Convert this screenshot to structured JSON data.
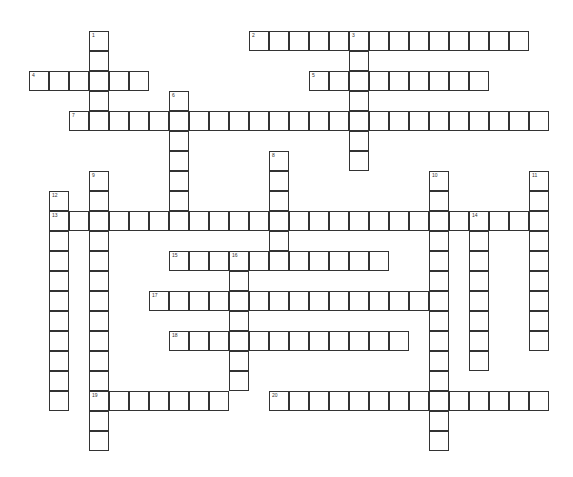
{
  "puzzle": {
    "type": "crossword",
    "cell_size": 20,
    "origin_x": 29,
    "origin_y": 31,
    "colors": {
      "border": "#333333",
      "cell_fill": "#ffffff",
      "background": "#ffffff"
    },
    "entries": [
      {
        "number": "1",
        "direction": "down",
        "col": 3,
        "row": 0,
        "length": 5
      },
      {
        "number": "2",
        "direction": "across",
        "col": 11,
        "row": 0,
        "length": 14
      },
      {
        "number": "3",
        "direction": "down",
        "col": 16,
        "row": 0,
        "length": 7
      },
      {
        "number": "4",
        "direction": "across",
        "col": 0,
        "row": 2,
        "length": 6
      },
      {
        "number": "5",
        "direction": "across",
        "col": 14,
        "row": 2,
        "length": 9
      },
      {
        "number": "6",
        "direction": "down",
        "col": 7,
        "row": 3,
        "length": 7
      },
      {
        "number": "7",
        "direction": "across",
        "col": 2,
        "row": 4,
        "length": 24
      },
      {
        "number": "8",
        "direction": "down",
        "col": 12,
        "row": 6,
        "length": 6
      },
      {
        "number": "9",
        "direction": "down",
        "col": 3,
        "row": 7,
        "length": 14
      },
      {
        "number": "10",
        "direction": "down",
        "col": 20,
        "row": 7,
        "length": 14
      },
      {
        "number": "11",
        "direction": "down",
        "col": 25,
        "row": 7,
        "length": 9
      },
      {
        "number": "12",
        "direction": "down",
        "col": 1,
        "row": 8,
        "length": 11
      },
      {
        "number": "13",
        "direction": "across",
        "col": 1,
        "row": 9,
        "length": 25
      },
      {
        "number": "14",
        "direction": "down",
        "col": 22,
        "row": 9,
        "length": 8
      },
      {
        "number": "15",
        "direction": "across",
        "col": 7,
        "row": 11,
        "length": 11
      },
      {
        "number": "16",
        "direction": "down",
        "col": 10,
        "row": 11,
        "length": 7
      },
      {
        "number": "17",
        "direction": "across",
        "col": 6,
        "row": 13,
        "length": 15
      },
      {
        "number": "18",
        "direction": "across",
        "col": 7,
        "row": 15,
        "length": 12
      },
      {
        "number": "19",
        "direction": "across",
        "col": 3,
        "row": 18,
        "length": 7
      },
      {
        "number": "20",
        "direction": "across",
        "col": 12,
        "row": 18,
        "length": 14
      }
    ]
  }
}
